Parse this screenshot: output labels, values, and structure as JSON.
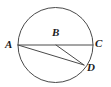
{
  "figure": {
    "kind": "circle-geometry-diagram",
    "background_color": "#ffffff",
    "stroke_color": "#4a4a4a",
    "label_color": "#1b1b1b",
    "stroke_width": 1,
    "canvas": {
      "width": 111,
      "height": 87
    }
  },
  "circle": {
    "center_x": 55.5,
    "center_y": 45,
    "radius": 37.5
  },
  "points": [
    {
      "id": "A",
      "label": "A",
      "x": 18,
      "y": 45,
      "label_x": 5,
      "label_y": 39
    },
    {
      "id": "B",
      "label": "B",
      "x": 56,
      "y": 45,
      "label_x": 52,
      "label_y": 27
    },
    {
      "id": "C",
      "label": "C",
      "x": 93,
      "y": 45,
      "label_x": 95,
      "label_y": 38
    },
    {
      "id": "D",
      "label": "D",
      "x": 84,
      "y": 65,
      "label_x": 87,
      "label_y": 62
    }
  ],
  "segments": [
    {
      "id": "AC",
      "from": "A",
      "to": "C",
      "x1": 18,
      "y1": 45,
      "x2": 93,
      "y2": 45
    },
    {
      "id": "AD",
      "from": "A",
      "to": "D",
      "x1": 18,
      "y1": 45,
      "x2": 84,
      "y2": 65
    },
    {
      "id": "BD",
      "from": "B",
      "to": "D",
      "x1": 56,
      "y1": 45,
      "x2": 84,
      "y2": 65
    }
  ],
  "labels": {
    "A": "A",
    "B": "B",
    "C": "C",
    "D": "D"
  }
}
